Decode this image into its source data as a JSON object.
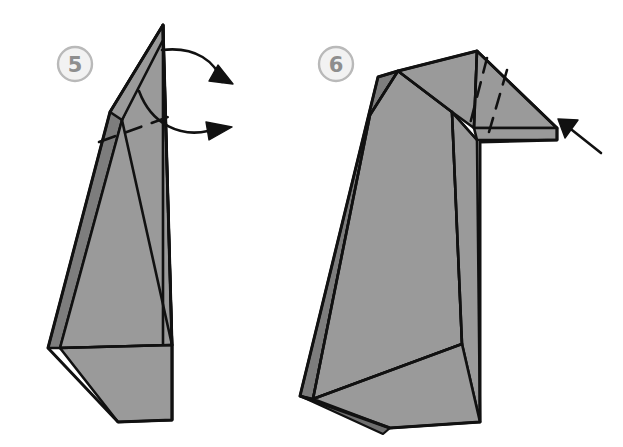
{
  "figure": {
    "background_color": "#ffffff",
    "width": 623,
    "height": 447
  },
  "palette": {
    "paper_front": "#9a9a9a",
    "paper_shade": "#7d7d7d",
    "paper_shade_dark": "#6f6f6f",
    "outline": "#111111",
    "badge_fill": "#f2f2f2",
    "badge_stroke": "#b9b9b9",
    "badge_text": "#8e8e8e",
    "arrow": "#111111"
  },
  "steps": [
    {
      "id": "step-5",
      "number": "5",
      "badge": {
        "cx": 75,
        "cy": 64,
        "r": 17
      },
      "arrows": [
        {
          "name": "valley-fold-arrow-upper",
          "type": "curved",
          "direction": "right"
        },
        {
          "name": "valley-fold-arrow-lower",
          "type": "curved",
          "direction": "right"
        }
      ],
      "fold_lines": [
        {
          "name": "dashed-fold-line-neck",
          "type": "dashed"
        }
      ]
    },
    {
      "id": "step-6",
      "number": "6",
      "badge": {
        "cx": 336,
        "cy": 64,
        "r": 17
      },
      "arrows": [
        {
          "name": "push-arrow-beak",
          "type": "straight",
          "direction": "left"
        }
      ],
      "fold_lines": [
        {
          "name": "dashed-fold-line-head-a",
          "type": "dashed"
        },
        {
          "name": "dashed-fold-line-head-b",
          "type": "dashed"
        }
      ]
    }
  ]
}
